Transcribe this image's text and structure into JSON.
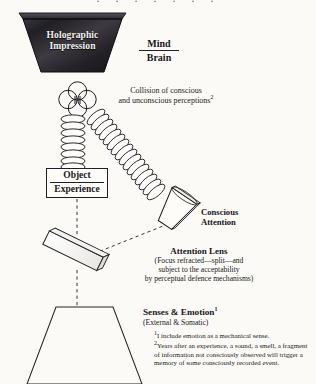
{
  "page": {
    "top_bleed_text": "·  ·   ·    ·     ·      ·       ·",
    "background_hex": "#fbfaf7",
    "ink_hex": "#18161a"
  },
  "diagram": {
    "holographic": {
      "line1": "Holographic",
      "line2": "Impression",
      "shape": "filled-trapezoid-wide-top",
      "fill_hex": "#2b2a2e"
    },
    "mind_brain": {
      "numerator": "Mind",
      "denominator": "Brain"
    },
    "collision": {
      "line1": "Collision of conscious",
      "line2": "and unconscious perceptions",
      "footnote_marker": "2"
    },
    "object_experience": {
      "line1": "Object",
      "line2": "Experience"
    },
    "conscious_attention": {
      "line1": "Conscious",
      "line2": "Attention"
    },
    "attention_lens": {
      "heading": "Attention Lens",
      "sub1": "(Focus refracted—split—and",
      "sub2": "subject to the acceptability",
      "sub3": "by perceptual defence mechanisms)"
    },
    "senses_emotion": {
      "heading": "Senses & Emotion",
      "footnote_marker": "1",
      "sub": "(External & Somatic)"
    }
  },
  "footnotes": {
    "one_marker": "1",
    "one_text": "I include emotion as a mechanical sense.",
    "two_marker": "2",
    "two_text": "Years after an experience, a sound, a smell, a fragment of information not consciously observed will trigger a memory of some consciously recorded event."
  }
}
